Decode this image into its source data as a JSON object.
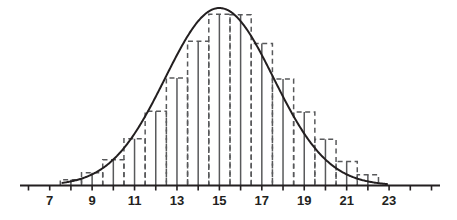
{
  "chart_data": {
    "type": "bar",
    "title": "",
    "subtitle": "",
    "xlabel": "",
    "ylabel": "",
    "grid": false,
    "legend": null,
    "axis_color": "#231f20",
    "curve_color": "#231f20",
    "bar_outline_color": "#58595b",
    "bar_outline_style": "dashed",
    "stem_color": "#58595b",
    "stem_style": "solid",
    "xlim": [
      5.6,
      25.4
    ],
    "ylim": [
      0,
      1.0
    ],
    "x_axis_ticks": [
      6,
      7,
      8,
      9,
      10,
      11,
      12,
      13,
      14,
      15,
      16,
      17,
      18,
      19,
      20,
      21,
      22,
      23,
      24,
      25
    ],
    "x_tick_labels": [
      "",
      "7",
      "",
      "9",
      "",
      "11",
      "",
      "13",
      "",
      "15",
      "",
      "17",
      "",
      "19",
      "",
      "21",
      "",
      "23",
      "",
      ""
    ],
    "labeled_ticks": [
      7,
      9,
      11,
      13,
      15,
      17,
      19,
      21,
      23
    ],
    "curve": {
      "name": "normal density curve",
      "distribution": "normal",
      "mean": 15,
      "std_dev": 2.55,
      "peak_value": 1.0,
      "x_start": 7.6,
      "x_end": 22.9
    },
    "categories": [
      8,
      9,
      10,
      11,
      12,
      13,
      14,
      15,
      16,
      17,
      18,
      19,
      20,
      21,
      22
    ],
    "bar_width": 1,
    "values": [
      0.032,
      0.072,
      0.145,
      0.263,
      0.418,
      0.605,
      0.812,
      0.965,
      0.962,
      0.8,
      0.6,
      0.414,
      0.26,
      0.135,
      0.06
    ],
    "stems": [
      {
        "x": 8,
        "y": 0.032
      },
      {
        "x": 9,
        "y": 0.072
      },
      {
        "x": 10,
        "y": 0.145
      },
      {
        "x": 11,
        "y": 0.263
      },
      {
        "x": 12,
        "y": 0.418
      },
      {
        "x": 13,
        "y": 0.605
      },
      {
        "x": 14,
        "y": 0.812
      },
      {
        "x": 15,
        "y": 0.965
      },
      {
        "x": 16,
        "y": 0.962
      },
      {
        "x": 17,
        "y": 0.8
      },
      {
        "x": 18,
        "y": 0.6
      },
      {
        "x": 19,
        "y": 0.414
      },
      {
        "x": 20,
        "y": 0.26
      },
      {
        "x": 21,
        "y": 0.135
      },
      {
        "x": 22,
        "y": 0.06
      }
    ]
  }
}
